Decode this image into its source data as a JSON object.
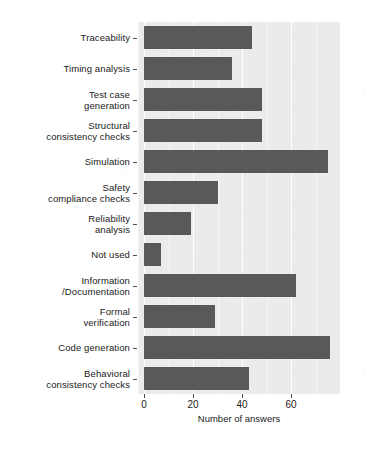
{
  "chart_data": {
    "type": "bar",
    "orientation": "horizontal",
    "title": "",
    "xlabel": "Number of answers",
    "ylabel": "",
    "xlim": [
      0,
      78
    ],
    "xticks": [
      0,
      20,
      40,
      60
    ],
    "xtick_labels": [
      "0",
      "20",
      "40",
      "60"
    ],
    "grid": true,
    "grid_axis": "x",
    "legend": false,
    "categories": [
      "Traceability",
      "Timing analysis",
      "Test case\ngeneration",
      "Structural\nconsistency checks",
      "Simulation",
      "Safety\ncompliance checks",
      "Reliability\nanalysis",
      "Not used",
      "Information\n/Documentation",
      "Formal\nverification",
      "Code generation",
      "Behavioral\nconsistency checks"
    ],
    "values": [
      44,
      36,
      48,
      48,
      75,
      30,
      19,
      7,
      62,
      29,
      76,
      43
    ],
    "bar_color": "#595959",
    "panel_color": "#ebebeb",
    "grid_color": "#ffffff"
  },
  "axis": {
    "x_title": "Number of answers",
    "tick_labels": [
      "0",
      "20",
      "40",
      "60"
    ]
  },
  "categories": [
    {
      "line1": "Traceability",
      "line2": ""
    },
    {
      "line1": "Timing analysis",
      "line2": ""
    },
    {
      "line1": "Test case",
      "line2": "generation"
    },
    {
      "line1": "Structural",
      "line2": "consistency checks"
    },
    {
      "line1": "Simulation",
      "line2": ""
    },
    {
      "line1": "Safety",
      "line2": "compliance checks"
    },
    {
      "line1": "Reliability",
      "line2": "analysis"
    },
    {
      "line1": "Not used",
      "line2": ""
    },
    {
      "line1": "Information",
      "line2": "/Documentation"
    },
    {
      "line1": "Formal",
      "line2": "verification"
    },
    {
      "line1": "Code generation",
      "line2": ""
    },
    {
      "line1": "Behavioral",
      "line2": "consistency checks"
    }
  ]
}
